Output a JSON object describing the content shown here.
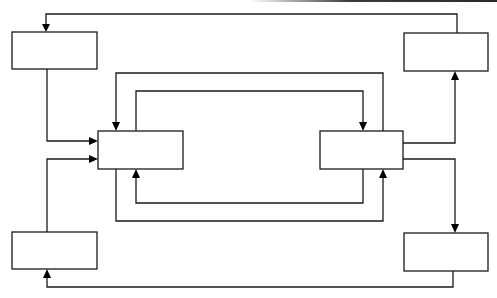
{
  "diagram": {
    "type": "block-diagram",
    "colors": {
      "line": "#1a1a1a",
      "arrowhead": "#000000",
      "background": "#ffffff"
    },
    "boxes": [
      {
        "id": "top-left",
        "label": "",
        "x": 12,
        "y": 32,
        "w": 85,
        "h": 37
      },
      {
        "id": "bottom-left",
        "label": "",
        "x": 12,
        "y": 232,
        "w": 85,
        "h": 37
      },
      {
        "id": "center-left",
        "label": "",
        "x": 98,
        "y": 131,
        "w": 85,
        "h": 38
      },
      {
        "id": "center-right",
        "label": "",
        "x": 320,
        "y": 131,
        "w": 83,
        "h": 38
      },
      {
        "id": "top-right",
        "label": "",
        "x": 404,
        "y": 33,
        "w": 84,
        "h": 38
      },
      {
        "id": "bottom-right",
        "label": "",
        "x": 404,
        "y": 233,
        "w": 84,
        "h": 38
      }
    ],
    "connections": [
      {
        "from": "top-right",
        "to": "top-left",
        "points": "457,33 457,14 46,14 46,28",
        "head": "46,32 42,24 50,24"
      },
      {
        "from": "top-left",
        "to": "center-left",
        "points": "47,69 47,141 90,141",
        "head": "98,141 89,137 89,145"
      },
      {
        "from": "bottom-left",
        "to": "center-left",
        "points": "47,232 47,159 90,159",
        "head": "98,159 89,155 89,163"
      },
      {
        "from": "center-right",
        "to": "center-left",
        "points": "383,131 383,73 116,73 116,124",
        "head": "116,131 112,122 120,122"
      },
      {
        "from": "center-left",
        "to": "center-right",
        "points": "136,131 136,91 363,91 363,124",
        "head": "363,131 359,122 367,122"
      },
      {
        "from": "center-right",
        "to": "center-left",
        "points": "363,169 363,203 136,203 136,176",
        "head": "136,169 132,178 140,178"
      },
      {
        "from": "center-left",
        "to": "center-right",
        "points": "116,169 116,221 383,221 383,176",
        "head": "383,169 379,178 387,178"
      },
      {
        "from": "center-right",
        "to": "top-right",
        "points": "403,143 455,143 455,78",
        "head": "455,71 451,80 459,80"
      },
      {
        "from": "center-right",
        "to": "bottom-right",
        "points": "403,159 455,159 455,226",
        "head": "455,233 451,224 459,224"
      },
      {
        "from": "bottom-right",
        "to": "bottom-left",
        "points": "453,271 453,287 47,287 47,276",
        "head": "47,269 43,278 51,278"
      }
    ]
  }
}
